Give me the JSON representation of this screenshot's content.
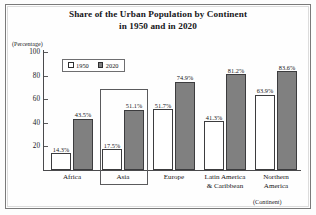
{
  "chart_data": {
    "type": "bar",
    "title": "Share of the Urban Population by Continent",
    "title_line2": "in 1950 and in 2020",
    "ylabel": "(Percentage)",
    "xlabel": "(Continent)",
    "ylim": [
      0,
      100
    ],
    "yticks": [
      100,
      80,
      60,
      40,
      20
    ],
    "grid": false,
    "legend_position": "top-left-inside",
    "categories": [
      "Africa",
      "Asia",
      "Europe",
      "Latin America & Caribbean",
      "Northern America"
    ],
    "category_lines": [
      [
        "Africa"
      ],
      [
        "Asia"
      ],
      [
        "Europe"
      ],
      [
        "Latin America",
        "& Caribbean"
      ],
      [
        "Northern",
        "America"
      ]
    ],
    "series": [
      {
        "name": "1950",
        "color": "#ffffff",
        "values": [
          14.3,
          17.5,
          51.7,
          41.3,
          63.9
        ],
        "value_labels": [
          "14.3%",
          "17.5%",
          "51.7%",
          "41.3%",
          "63.9%"
        ]
      },
      {
        "name": "2020",
        "color": "#808080",
        "values": [
          43.5,
          51.1,
          74.9,
          81.2,
          83.6
        ],
        "value_labels": [
          "43.5%",
          "51.1%",
          "74.9%",
          "81.2%",
          "83.6%"
        ]
      }
    ],
    "annotations": [
      {
        "type": "highlight-box",
        "target_category": "Asia",
        "note": "rectangle outline drawn around the Asia bar group and its label"
      }
    ]
  },
  "legend": {
    "items": [
      {
        "label": "1950",
        "swatch": "white-square-icon"
      },
      {
        "label": "2020",
        "swatch": "gray-square-icon"
      }
    ]
  },
  "colors": {
    "series_1950": "#ffffff",
    "series_2020": "#808080",
    "axis": "#4a4a4c",
    "text": "#141416",
    "frame": "#7a7a7a",
    "background": "#fdfdfd"
  }
}
